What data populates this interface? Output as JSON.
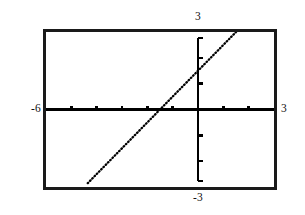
{
  "screen": {
    "kind": "graphing-calculator-viewport",
    "background_color": "#ffffff",
    "frame_color": "#1a1a1a",
    "plot_color": "#000000"
  },
  "labels": {
    "ymax": "3",
    "ymin": "-3",
    "xmin": "-6",
    "xmax": "3"
  },
  "chart_data": {
    "type": "line",
    "title": "",
    "xlabel": "",
    "ylabel": "",
    "xlim": [
      -6,
      3
    ],
    "ylim": [
      -3,
      3
    ],
    "xtick_labels": [
      "-6",
      "3"
    ],
    "ytick_labels": [
      "-3",
      "3"
    ],
    "xticks": [
      -6,
      -5,
      -4,
      -3,
      -2,
      -1,
      0,
      1,
      2,
      3
    ],
    "yticks": [
      -3,
      -2,
      -1,
      0,
      1,
      2,
      3
    ],
    "grid": false,
    "legend": "none",
    "axes_style": "centered-crosshair-with-tick-marks",
    "series": [
      {
        "name": "y = x + 1.5",
        "style": "dotted",
        "slope": 1,
        "intercept": 1.5,
        "x_intercept": -1.5,
        "x": [
          -4.35,
          -3.5,
          -3,
          -2.5,
          -2,
          -1.5,
          -1,
          -0.5,
          0,
          0.5,
          1,
          1.5,
          2
        ],
        "y": [
          -2.85,
          -2,
          -1.5,
          -1,
          -0.5,
          0,
          0.5,
          1,
          1.5,
          2,
          2.5,
          3,
          3.5
        ],
        "x_start": -4.35,
        "x_end": 1.5
      }
    ]
  }
}
